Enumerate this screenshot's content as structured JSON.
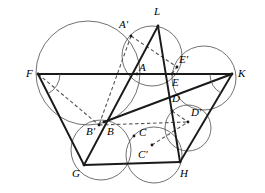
{
  "figure": {
    "width": 265,
    "height": 193,
    "stroke_color": "#1a1a1a",
    "thin_stroke_color": "#4d4d4d",
    "dashed_stroke_color": "#555555",
    "background": "#ffffff"
  },
  "labels": {
    "F": "F",
    "K": "K",
    "L": "L",
    "G": "G",
    "H": "H",
    "A": "A",
    "B": "B",
    "C": "C",
    "D": "D",
    "E": "E",
    "Ap": "A'",
    "Bp": "B'",
    "Cp": "C'",
    "Dp": "D'",
    "Ep": "E'"
  },
  "chart_data": {
    "type": "scatter",
    "xlabel": "",
    "ylabel": "",
    "xlim": [
      0,
      265
    ],
    "ylim": [
      0,
      193
    ],
    "grid": false,
    "legend": "none",
    "points": [
      {
        "name": "F",
        "label": "F",
        "x": 38,
        "y": 74,
        "label_x": 26,
        "label_y": 68
      },
      {
        "name": "K",
        "label": "K",
        "x": 232,
        "y": 74,
        "label_x": 238,
        "label_y": 68
      },
      {
        "name": "L",
        "label": "L",
        "x": 158,
        "y": 26,
        "label_x": 154,
        "label_y": 6
      },
      {
        "name": "G",
        "label": "G",
        "x": 84,
        "y": 165,
        "label_x": 72,
        "label_y": 168
      },
      {
        "name": "H",
        "label": "H",
        "x": 180,
        "y": 162,
        "label_x": 180,
        "label_y": 168
      },
      {
        "name": "A",
        "label": "A",
        "x": 137,
        "y": 74,
        "label_x": 139,
        "label_y": 62
      },
      {
        "name": "B",
        "label": "B",
        "x": 104,
        "y": 122,
        "label_x": 107,
        "label_y": 126
      },
      {
        "name": "C",
        "label": "C",
        "x": 134,
        "y": 136,
        "label_x": 139,
        "label_y": 127
      },
      {
        "name": "D",
        "label": "D",
        "x": 172,
        "y": 111,
        "label_x": 172,
        "label_y": 93
      },
      {
        "name": "E",
        "label": "E",
        "x": 172,
        "y": 74,
        "label_x": 172,
        "label_y": 77
      },
      {
        "name": "Ap",
        "label": "A'",
        "x": 131,
        "y": 36,
        "label_x": 119,
        "label_y": 19
      },
      {
        "name": "Bp",
        "label": "B'",
        "x": 99,
        "y": 125,
        "label_x": 86,
        "label_y": 126
      },
      {
        "name": "Cp",
        "label": "C'",
        "x": 152,
        "y": 145,
        "label_x": 138,
        "label_y": 149
      },
      {
        "name": "Dp",
        "label": "D'",
        "x": 188,
        "y": 122,
        "label_x": 191,
        "label_y": 107
      },
      {
        "name": "Ep",
        "label": "E'",
        "x": 177,
        "y": 67,
        "label_x": 179,
        "label_y": 54
      }
    ],
    "circles": [
      {
        "name": "circle-F-A-B-large",
        "cx": 88,
        "cy": 73,
        "r": 52
      },
      {
        "name": "circle-L-A-E",
        "cx": 152,
        "cy": 56,
        "r": 30
      },
      {
        "name": "circle-K-E-D",
        "cx": 204,
        "cy": 78,
        "r": 32
      },
      {
        "name": "circle-H-D-C",
        "cx": 188,
        "cy": 128,
        "r": 23
      },
      {
        "name": "circle-G-B-C",
        "cx": 101,
        "cy": 150,
        "r": 30
      },
      {
        "name": "circle-C-bottom",
        "cx": 154,
        "cy": 155,
        "r": 28
      }
    ],
    "solid_segments": [
      {
        "name": "seg-F-K",
        "x1": 38,
        "y1": 74,
        "x2": 232,
        "y2": 74
      },
      {
        "name": "seg-F-G",
        "x1": 38,
        "y1": 74,
        "x2": 84,
        "y2": 165
      },
      {
        "name": "seg-L-G",
        "x1": 158,
        "y1": 26,
        "x2": 84,
        "y2": 165
      },
      {
        "name": "seg-L-H",
        "x1": 158,
        "y1": 26,
        "x2": 180,
        "y2": 162
      },
      {
        "name": "seg-K-H",
        "x1": 232,
        "y1": 74,
        "x2": 180,
        "y2": 162
      },
      {
        "name": "seg-G-H",
        "x1": 84,
        "y1": 165,
        "x2": 180,
        "y2": 162
      },
      {
        "name": "seg-K-B",
        "x1": 232,
        "y1": 74,
        "x2": 104,
        "y2": 122
      }
    ],
    "dashed_segments": [
      {
        "name": "dash-Ap-Bp",
        "x1": 131,
        "y1": 36,
        "x2": 99,
        "y2": 125
      },
      {
        "name": "dash-Ap-Ep",
        "x1": 131,
        "y1": 36,
        "x2": 177,
        "y2": 67
      },
      {
        "name": "dash-F-Bp",
        "x1": 38,
        "y1": 74,
        "x2": 99,
        "y2": 125
      },
      {
        "name": "dash-Bp-Dp",
        "x1": 99,
        "y1": 125,
        "x2": 188,
        "y2": 122
      },
      {
        "name": "dash-Cp-Dp",
        "x1": 152,
        "y1": 145,
        "x2": 188,
        "y2": 122
      },
      {
        "name": "dash-D-Dp",
        "x1": 172,
        "y1": 111,
        "x2": 188,
        "y2": 122
      },
      {
        "name": "dash-E-Ep",
        "x1": 172,
        "y1": 74,
        "x2": 177,
        "y2": 67
      }
    ],
    "angle_arcs": [
      {
        "name": "arc-at-F",
        "cx": 38,
        "cy": 74,
        "r": 22,
        "a1": 0,
        "a2": 63
      },
      {
        "name": "arc-at-K",
        "cx": 232,
        "cy": 74,
        "r": 22,
        "a1": 120,
        "a2": 180
      }
    ]
  }
}
